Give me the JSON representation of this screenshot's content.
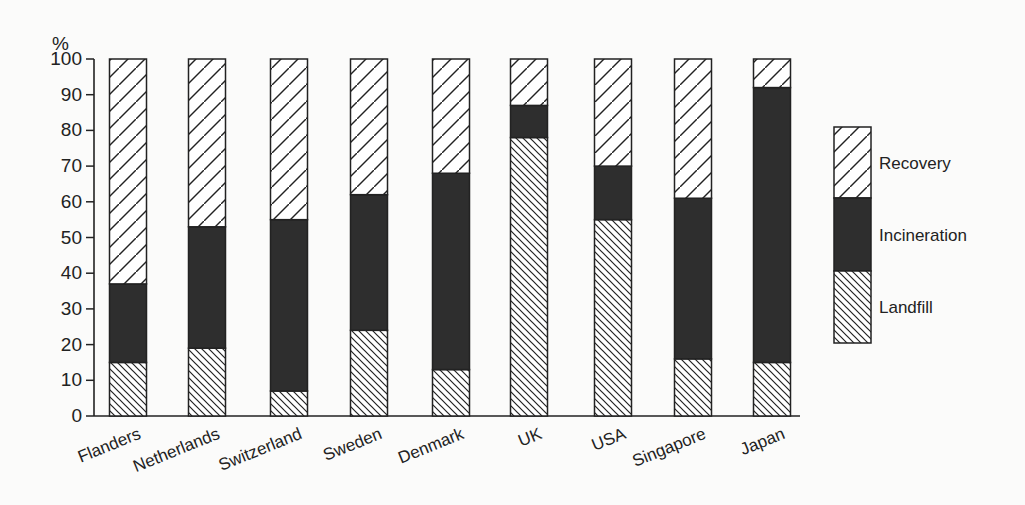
{
  "chart_data": {
    "type": "bar",
    "stacked": true,
    "title": "",
    "xlabel": "",
    "ylabel": "%",
    "ylim": [
      0,
      100
    ],
    "yticks": [
      0,
      10,
      20,
      30,
      40,
      50,
      60,
      70,
      80,
      90,
      100
    ],
    "categories": [
      "Flanders",
      "Netherlands",
      "Switzerland",
      "Sweden",
      "Denmark",
      "UK",
      "USA",
      "Singapore",
      "Japan"
    ],
    "series": [
      {
        "name": "Landfill",
        "pattern": "backslash-hatch",
        "values": [
          15,
          19,
          7,
          24,
          13,
          78,
          55,
          16,
          15
        ]
      },
      {
        "name": "Incineration",
        "pattern": "solid-dark",
        "values": [
          22,
          34,
          48,
          38,
          55,
          9,
          15,
          45,
          77
        ]
      },
      {
        "name": "Recovery",
        "pattern": "slash-hatch",
        "values": [
          63,
          47,
          45,
          38,
          32,
          13,
          30,
          39,
          8
        ]
      }
    ],
    "legend": {
      "position": "right",
      "entries": [
        "Recovery",
        "Incineration",
        "Landfill"
      ]
    },
    "grid": false
  },
  "colors": {
    "incineration": "#2e2e2e",
    "line": "#222222",
    "background": "#fbfbfa"
  }
}
